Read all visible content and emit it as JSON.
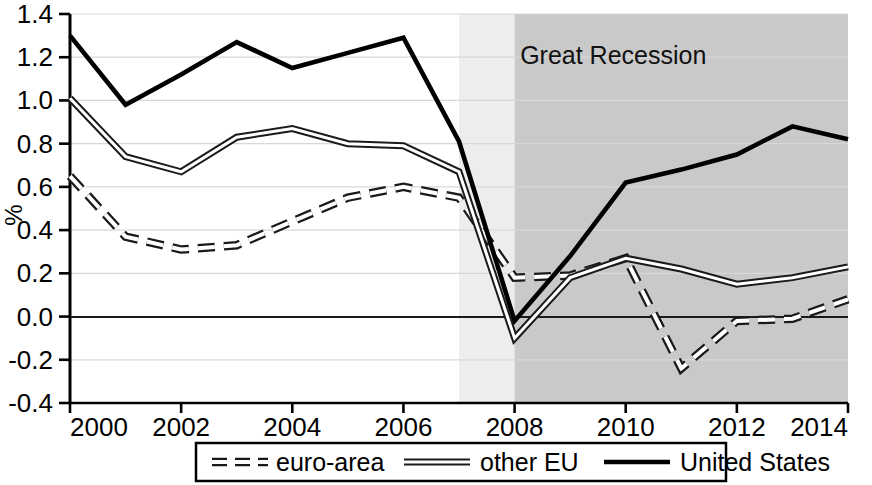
{
  "chart_data": {
    "type": "line",
    "title": "",
    "subtitle": "",
    "xlabel": "",
    "ylabel": "%",
    "xlim": [
      2000,
      2014
    ],
    "ylim": [
      -0.4,
      1.4
    ],
    "ytick_step": 0.2,
    "grid": true,
    "legend_position": "bottom",
    "x": [
      2000,
      2001,
      2002,
      2003,
      2004,
      2005,
      2006,
      2007,
      2008,
      2009,
      2010,
      2011,
      2012,
      2013,
      2014
    ],
    "xtick_labels": [
      "2000",
      "2002",
      "2004",
      "2006",
      "2008",
      "2010",
      "2012",
      "2014"
    ],
    "xtick_values": [
      2000,
      2002,
      2004,
      2006,
      2008,
      2010,
      2012,
      2014
    ],
    "ytick_labels": [
      "1.4",
      "1.2",
      "1.0",
      "0.8",
      "0.6",
      "0.4",
      "0.2",
      "0.0",
      "-0.2",
      "-0.4"
    ],
    "ytick_values": [
      1.4,
      1.2,
      1.0,
      0.8,
      0.6,
      0.4,
      0.2,
      0.0,
      -0.2,
      -0.4
    ],
    "series": [
      {
        "name": "euro-area",
        "style": "dashed",
        "color": "#1a1a1a",
        "values": [
          0.65,
          0.37,
          0.31,
          0.33,
          0.44,
          0.55,
          0.6,
          0.55,
          0.18,
          0.19,
          0.27,
          -0.24,
          -0.02,
          -0.01,
          0.08
        ]
      },
      {
        "name": "other EU",
        "style": "double-solid",
        "color": "#1a1a1a",
        "values": [
          1.01,
          0.74,
          0.67,
          0.83,
          0.87,
          0.8,
          0.79,
          0.67,
          -0.1,
          0.18,
          0.27,
          0.22,
          0.15,
          0.18,
          0.23
        ]
      },
      {
        "name": "United States",
        "style": "solid-thick",
        "color": "#000000",
        "values": [
          1.3,
          0.98,
          1.12,
          1.27,
          1.15,
          1.22,
          1.29,
          0.81,
          -0.02,
          0.28,
          0.62,
          0.68,
          0.75,
          0.88,
          0.82
        ]
      }
    ],
    "annotations": [
      {
        "text": "Great Recession",
        "x": 2008.1,
        "y": 1.17
      }
    ],
    "shaded_regions": [
      {
        "label": "pre-recession-light",
        "x_start": 2007,
        "x_end": 2008,
        "color": "#ededed"
      },
      {
        "label": "Great Recession",
        "x_start": 2008,
        "x_end": 2014,
        "color": "#c9c9c9"
      }
    ],
    "zero_line": 0.0
  },
  "legend": {
    "items": [
      {
        "label": "euro-area",
        "style": "dashed"
      },
      {
        "label": "other EU",
        "style": "double-solid"
      },
      {
        "label": "United States",
        "style": "solid-thick"
      }
    ]
  },
  "axes": {
    "ylabel": "%"
  }
}
